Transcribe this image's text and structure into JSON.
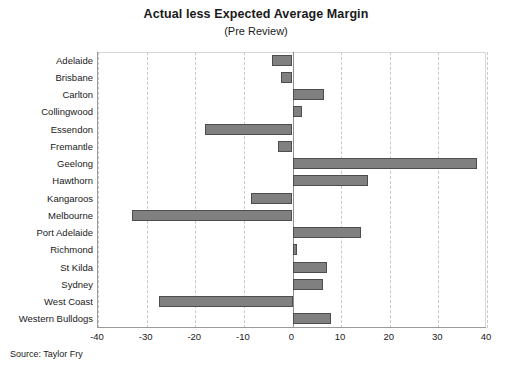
{
  "chart_data": {
    "type": "bar",
    "orientation": "horizontal",
    "title": "Actual less Expected Average Margin",
    "subtitle": "(Pre Review)",
    "xlabel": "",
    "ylabel": "",
    "xlim": [
      -40,
      40
    ],
    "xticks": [
      -40,
      -30,
      -20,
      -10,
      0,
      10,
      20,
      30,
      40
    ],
    "xtick_labels": [
      "-40",
      "-30",
      "-20",
      "-10",
      "0",
      "10",
      "20",
      "30",
      "40"
    ],
    "grid": "vertical-dashed",
    "legend": "none",
    "bar_color": "#808080",
    "bar_edge_color": "#4d4d4d",
    "categories": [
      "Adelaide",
      "Brisbane",
      "Carlton",
      "Collingwood",
      "Essendon",
      "Fremantle",
      "Geelong",
      "Hawthorn",
      "Kangaroos",
      "Melbourne",
      "Port Adelaide",
      "Richmond",
      "St Kilda",
      "Sydney",
      "West Coast",
      "Western Bulldogs"
    ],
    "values": [
      -4.3,
      -2.3,
      6.4,
      2.0,
      -18.0,
      -3.0,
      38.0,
      15.5,
      -8.5,
      -33.0,
      14.0,
      1.0,
      7.0,
      6.3,
      -27.5,
      8.0
    ]
  },
  "footer": {
    "source": "Source: Taylor Fry"
  }
}
